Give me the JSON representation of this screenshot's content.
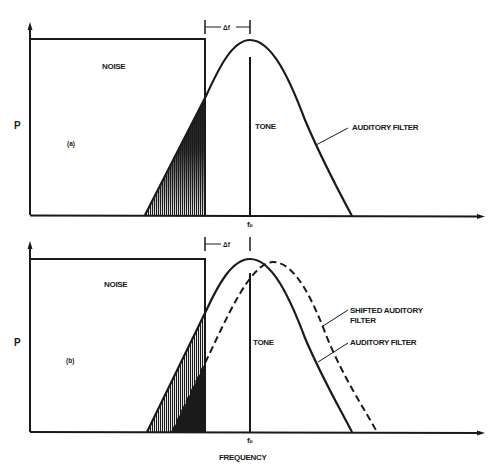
{
  "figure": {
    "y_axis_label": "P",
    "x_axis_label": "FREQUENCY",
    "tone_freq_label": "f₀",
    "delta_label": "Δf",
    "colors": {
      "ink": "#1a1a1a",
      "background": "#ffffff"
    }
  },
  "panels": [
    {
      "id": "a",
      "panel_label": "(a)",
      "noise_label": "NOISE",
      "tone_label": "TONE",
      "filter_label": "AUDITORY FILTER"
    },
    {
      "id": "b",
      "panel_label": "(b)",
      "noise_label": "NOISE",
      "tone_label": "TONE",
      "shifted_filter_label_line1": "SHIFTED AUDITORY",
      "shifted_filter_label_line2": "FILTER",
      "filter_label": "AUDITORY FILTER"
    }
  ]
}
